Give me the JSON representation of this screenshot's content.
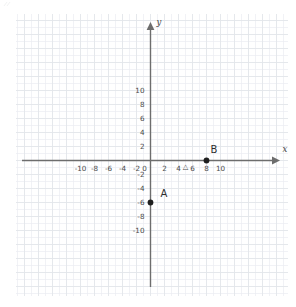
{
  "figure": {
    "kind": "coordinate-plane",
    "background_color": "#ffffff",
    "grid_color": "#ebedf2",
    "grid_major_color": "#e2e5ea",
    "axis_color": "#6d6d6d",
    "text_color": "#4a4a4a",
    "point_color": "#1f1f1f"
  },
  "chart_data": {
    "type": "scatter",
    "title": "",
    "subtitle": "",
    "xlabel": "x",
    "ylabel": "y",
    "xlim": [
      -11.5,
      11.5
    ],
    "ylim": [
      -11.5,
      11.5
    ],
    "grid": true,
    "grid_step": 1,
    "legend": "none",
    "x_ticks": [
      -10,
      -8,
      -6,
      -4,
      -2,
      0,
      2,
      4,
      6,
      8,
      10
    ],
    "x_tick_labels": [
      "-10",
      "-8",
      "-6",
      "-4",
      "-2",
      "0",
      "2",
      "4",
      "6",
      "8",
      "10"
    ],
    "y_ticks": [
      10,
      8,
      6,
      4,
      2,
      -2,
      -4,
      -6,
      -8,
      -10
    ],
    "y_tick_labels": [
      "10",
      "8",
      "6",
      "4",
      "2",
      "-2",
      "-4",
      "-6",
      "-8",
      "-10"
    ],
    "points": [
      {
        "label": "A",
        "x": 0,
        "y": -6
      },
      {
        "label": "B",
        "x": 8,
        "y": 0
      }
    ],
    "markers": [
      {
        "label": "triangle-marker",
        "glyph": "△",
        "x": 5,
        "y": -0.75
      }
    ],
    "annotations": []
  },
  "axes": {
    "x_axis_label": "x",
    "y_axis_label": "y",
    "origin_label": "0"
  },
  "points": {
    "a": {
      "name": "A",
      "x": 0,
      "y": -6,
      "coord_text": "A"
    },
    "b": {
      "name": "B",
      "x": 8,
      "y": 0,
      "coord_text": "B"
    }
  }
}
